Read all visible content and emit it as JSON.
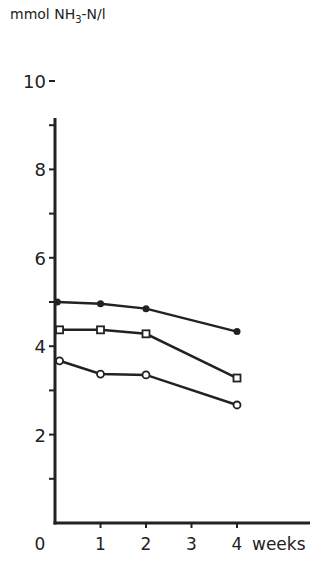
{
  "chart_data": {
    "type": "line",
    "title": "",
    "ylabel": "mmol NH3-N/l",
    "ylabel_parts": {
      "pre": "mmol NH",
      "sub": "3",
      "post": "-N/l"
    },
    "xlabel": "weeks",
    "x_ticks": [
      "0",
      "1",
      "2",
      "3",
      "4"
    ],
    "y_ticks": [
      "2",
      "4",
      "6",
      "8",
      "10"
    ],
    "y_minor_ticks": [
      1,
      3,
      5,
      7,
      9
    ],
    "xlim": [
      0,
      5.6
    ],
    "ylim": [
      0,
      10.5
    ],
    "grid": false,
    "legend": null,
    "series": [
      {
        "name": "filled circles",
        "marker": "filled-circle",
        "x": [
          0.05,
          1,
          2,
          4
        ],
        "values": [
          5.0,
          4.96,
          4.85,
          4.33
        ]
      },
      {
        "name": "open squares",
        "marker": "open-square",
        "x": [
          0.1,
          1,
          2,
          4
        ],
        "values": [
          4.37,
          4.37,
          4.28,
          3.28
        ]
      },
      {
        "name": "open circles",
        "marker": "open-circle",
        "x": [
          0.1,
          1,
          2,
          4
        ],
        "values": [
          3.67,
          3.37,
          3.35,
          2.67
        ]
      }
    ]
  },
  "colors": {
    "ink": "#222222",
    "background": "#ffffff"
  }
}
